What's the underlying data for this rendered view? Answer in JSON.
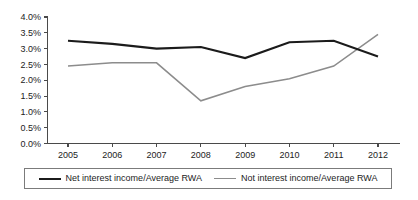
{
  "chart_data": {
    "type": "line",
    "title": "",
    "subtitle": "",
    "xlabel": "",
    "ylabel": "",
    "categories": [
      "2005",
      "2006",
      "2007",
      "2008",
      "2009",
      "2010",
      "2011",
      "2012"
    ],
    "series": [
      {
        "name": "Net interest income/Average RWA",
        "color": "#1b1b1b",
        "values": [
          3.25,
          3.15,
          3.0,
          3.05,
          2.7,
          3.2,
          3.25,
          2.75
        ]
      },
      {
        "name": "Not interest income/Average RWA",
        "color": "#8c8c8c",
        "values": [
          2.45,
          2.55,
          2.55,
          1.35,
          1.8,
          2.05,
          2.45,
          3.45
        ]
      }
    ],
    "ylim": [
      0.0,
      4.0
    ],
    "ytick_values": [
      0.0,
      0.5,
      1.0,
      1.5,
      2.0,
      2.5,
      3.0,
      3.5,
      4.0
    ],
    "ytick_labels": [
      "0.0%",
      "0.5%",
      "1.0%",
      "1.5%",
      "2.0%",
      "2.5%",
      "3.0%",
      "3.5%",
      "4.0%"
    ],
    "xtick_labels": [
      "2005",
      "2006",
      "2007",
      "2008",
      "2009",
      "2010",
      "2011",
      "2012"
    ],
    "grid": false,
    "legend_position": "bottom"
  },
  "legend": {
    "entries": [
      {
        "label": "Net interest income/Average RWA"
      },
      {
        "label": "Not interest income/Average RWA"
      }
    ]
  }
}
